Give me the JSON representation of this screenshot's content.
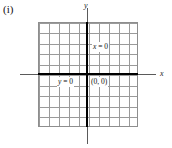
{
  "figure": {
    "part_label": "(i)",
    "axes": {
      "x_axis_name": "x",
      "y_axis_name": "y"
    },
    "annotations": {
      "vertical_line_label_var": "x",
      "vertical_line_label_rest": " = 0",
      "horizontal_line_label_var": "y",
      "horizontal_line_label_rest": " = 0",
      "origin_label": "(0, 0)"
    },
    "colors": {
      "grid_line": "#9a9a9a",
      "grid_border": "#8e8e8e",
      "axis_bold": "#000000",
      "axis_thin": "#5a5a5a",
      "text": "#1a1a1a",
      "background": "#ffffff"
    },
    "grid": {
      "columns": 10,
      "rows": 10,
      "origin_column_index": 5,
      "origin_row_index": 5
    }
  }
}
